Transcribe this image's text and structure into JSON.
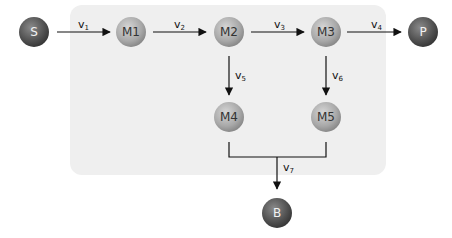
{
  "diagram": {
    "nodes": [
      {
        "id": "S",
        "label": "S",
        "type": "external"
      },
      {
        "id": "M1",
        "label": "M1",
        "type": "internal"
      },
      {
        "id": "M2",
        "label": "M2",
        "type": "internal"
      },
      {
        "id": "M3",
        "label": "M3",
        "type": "internal"
      },
      {
        "id": "P",
        "label": "P",
        "type": "external"
      },
      {
        "id": "M4",
        "label": "M4",
        "type": "internal"
      },
      {
        "id": "M5",
        "label": "M5",
        "type": "internal"
      },
      {
        "id": "B",
        "label": "B",
        "type": "external"
      }
    ],
    "edges": [
      {
        "from": "S",
        "to": "M1",
        "label": "v",
        "sub": "1"
      },
      {
        "from": "M1",
        "to": "M2",
        "label": "v",
        "sub": "2"
      },
      {
        "from": "M2",
        "to": "M3",
        "label": "v",
        "sub": "3"
      },
      {
        "from": "M3",
        "to": "P",
        "label": "v",
        "sub": "4"
      },
      {
        "from": "M2",
        "to": "M4",
        "label": "v",
        "sub": "5"
      },
      {
        "from": "M3",
        "to": "M5",
        "label": "v",
        "sub": "6"
      },
      {
        "from": [
          "M4",
          "M5"
        ],
        "to": "B",
        "label": "v",
        "sub": "7"
      }
    ],
    "colors": {
      "internal_node": "#a8a8a8",
      "external_node": "#555555",
      "region": "#efefef",
      "edge": "#111111"
    }
  }
}
